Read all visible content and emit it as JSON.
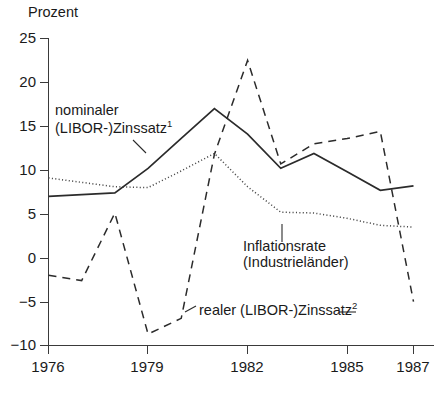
{
  "chart_data": {
    "type": "line",
    "title": "",
    "ylabel": "Prozent",
    "xlabel": "",
    "ylim": [
      -10,
      25
    ],
    "xlim": [
      1976,
      1987
    ],
    "grid": false,
    "legend_position": "inline-annotations",
    "y_ticks": [
      "25",
      "20",
      "15",
      "10",
      "5",
      "0",
      "−5",
      "−10"
    ],
    "y_tick_values": [
      25,
      20,
      15,
      10,
      5,
      0,
      -5,
      -10
    ],
    "x_ticks": [
      "1976",
      "1979",
      "1982",
      "1985",
      "1987"
    ],
    "x_tick_values": [
      1976,
      1979,
      1982,
      1985,
      1987
    ],
    "x": [
      1976,
      1977,
      1978,
      1979,
      1980,
      1981,
      1982,
      1983,
      1984,
      1985,
      1986,
      1987
    ],
    "series": [
      {
        "name": "nominaler (LIBOR-)Zinssatz",
        "style": "solid",
        "color": "#2b2b2b",
        "values": [
          7.0,
          7.2,
          7.4,
          10.2,
          13.6,
          17.0,
          14.1,
          10.2,
          11.9,
          9.8,
          7.7,
          8.2
        ]
      },
      {
        "name": "Inflationsrate (Industrieländer)",
        "style": "dotted",
        "color": "#4a4a4a",
        "values": [
          9.1,
          8.6,
          8.1,
          8.0,
          9.9,
          11.9,
          8.1,
          5.2,
          5.1,
          4.5,
          3.7,
          3.5
        ]
      },
      {
        "name": "realer (LIBOR-)Zinssatz",
        "style": "dashed",
        "color": "#2b2b2b",
        "values": [
          -2.0,
          -2.6,
          5.1,
          -8.7,
          -6.9,
          11.8,
          22.5,
          10.7,
          13.0,
          13.6,
          14.4,
          -5.0
        ]
      }
    ],
    "annotations": [
      {
        "id": "nominal-label",
        "line1": "nominaler",
        "line2": "(LIBOR-)Zinssatz",
        "superscript": "1"
      },
      {
        "id": "inflation-label",
        "line1": "Inflationsrate",
        "line2": "(Industrieländer)",
        "superscript": ""
      },
      {
        "id": "real-label",
        "line1": "realer (LIBOR-)Zinssatz",
        "line2": "",
        "superscript": "2"
      }
    ]
  },
  "axis": {
    "y_title": "Prozent"
  },
  "colors": {
    "axis": "#3a3a3a",
    "nominal": "#2b2b2b",
    "inflation": "#4a4a4a",
    "real": "#2b2b2b",
    "background": "#ffffff"
  }
}
